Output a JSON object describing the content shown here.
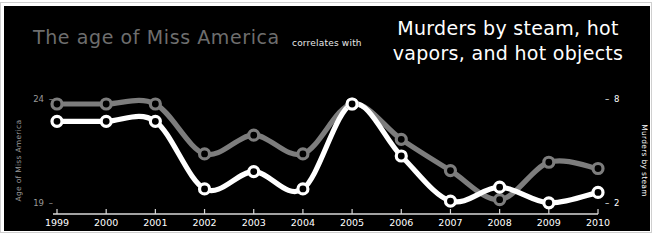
{
  "titles": {
    "left": "The age of Miss America",
    "connector": "correlates with",
    "right_line1": "Murders by steam, hot",
    "right_line2": "vapors, and hot objects"
  },
  "axes": {
    "left": {
      "label": "Age of Miss America",
      "ticks": [
        "24",
        "19"
      ],
      "color": "#9a9a9a"
    },
    "right": {
      "label": "Murders by steam",
      "ticks": [
        "8",
        "2"
      ],
      "color": "#ffffff"
    },
    "x": {
      "ticks": [
        "1999",
        "2000",
        "2001",
        "2002",
        "2003",
        "2004",
        "2005",
        "2006",
        "2007",
        "2008",
        "2009",
        "2010"
      ],
      "color": "#ffffff"
    }
  },
  "colors": {
    "background": "#000000",
    "page": "#ffffff",
    "series_age": "#7d7d7d",
    "series_murders": "#ffffff",
    "frame": "#cfcfcf"
  },
  "chart_data": {
    "type": "line",
    "title": "The age of Miss America correlates with Murders by steam, hot vapors, and hot objects",
    "xlabel": "",
    "x": [
      1999,
      2000,
      2001,
      2002,
      2003,
      2004,
      2005,
      2006,
      2007,
      2008,
      2009,
      2010
    ],
    "grid": false,
    "legend": "none",
    "series": [
      {
        "name": "Age of Miss America",
        "axis": "left",
        "ylabel": "Age of Miss America",
        "ylim": [
          19,
          24
        ],
        "yticks": [
          19,
          24
        ],
        "color": "#7d7d7d",
        "values": [
          24.0,
          24.0,
          24.0,
          21.6,
          22.5,
          21.6,
          24.0,
          22.3,
          20.8,
          19.4,
          21.2,
          20.9
        ]
      },
      {
        "name": "Murders by steam",
        "axis": "right",
        "ylabel": "Murders by steam",
        "ylim": [
          2,
          8
        ],
        "yticks": [
          2,
          8
        ],
        "color": "#ffffff",
        "values": [
          7.0,
          7.0,
          7.0,
          3.1,
          4.1,
          3.1,
          8.0,
          5.0,
          2.4,
          3.2,
          2.3,
          2.9
        ]
      }
    ]
  }
}
